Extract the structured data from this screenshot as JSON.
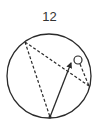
{
  "diagram": {
    "top_label": "12",
    "colors": {
      "stroke": "#2a2a2a",
      "background": "#ffffff"
    },
    "circle": {
      "cx": 49,
      "cy": 76,
      "r": 42
    },
    "points": {
      "A": {
        "x": 25,
        "y": 42
      },
      "B": {
        "x": 89,
        "y": 86
      },
      "C": {
        "x": 50,
        "y": 117
      },
      "arrow_tip": {
        "x": 72,
        "y": 62
      },
      "Q": {
        "x": 78,
        "y": 60,
        "r": 4
      }
    },
    "segments": [
      {
        "from": "A",
        "to": "C",
        "style": "dashed"
      },
      {
        "from": "A",
        "to": "B",
        "style": "dashed"
      },
      {
        "from": "Q",
        "to": "B",
        "style": "dashed"
      },
      {
        "from": "C",
        "to": "arrow_tip",
        "style": "solid-arrow"
      }
    ]
  }
}
